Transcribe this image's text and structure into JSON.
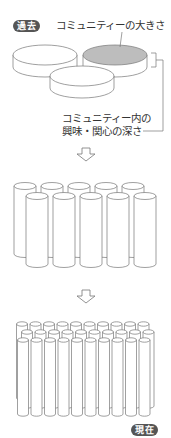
{
  "diagram": {
    "badges": {
      "past": "過去",
      "present": "現在"
    },
    "labels": {
      "community_size": "コミュニティーの大きさ",
      "interest_depth_line1": "コミュニティー内の",
      "interest_depth_line2": "興味・関心の深さ"
    },
    "stages": [
      {
        "name": "past",
        "shape": "wide-shallow-discs",
        "count": 3,
        "highlighted_index": 1
      },
      {
        "name": "middle",
        "shape": "tall-cylinders",
        "rows": [
          5,
          5
        ]
      },
      {
        "name": "present",
        "shape": "thin-tall-cylinders",
        "rows": [
          10,
          10,
          10
        ]
      }
    ],
    "arrows": [
      "down-arrow",
      "down-arrow"
    ],
    "colors": {
      "stroke": "#777777",
      "highlight_fill": "#bdbdbd",
      "badge_bg": "#555555",
      "text": "#333333"
    }
  }
}
